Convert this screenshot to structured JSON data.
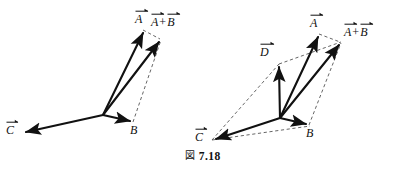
{
  "figure": {
    "caption_mark": "図",
    "caption_number": "7.18",
    "caption_full": "図 7.18",
    "background_color": "#ffffff",
    "solid_vector_color": "#111111",
    "dashed_line_color": "#555555"
  },
  "diagrams": [
    {
      "id": "left-diagram",
      "name": "two-vector-addition",
      "origin": {
        "x": 103,
        "y": 115
      },
      "vectors": [
        {
          "name": "vector-a",
          "label": "A",
          "arrow_over": true,
          "tip": {
            "x": 143,
            "y": 30
          },
          "label_pos": {
            "x": 137,
            "y": 10
          }
        },
        {
          "name": "vector-b",
          "label": "B",
          "arrow_over": false,
          "tip": {
            "x": 133,
            "y": 122
          },
          "label_pos": {
            "x": 131,
            "y": 126
          }
        },
        {
          "name": "vector-c",
          "label": "C",
          "arrow_over": true,
          "tip": {
            "x": 22,
            "y": 133
          },
          "label_pos": {
            "x": 8,
            "y": 122
          }
        },
        {
          "name": "vector-a-plus-b",
          "label": "A",
          "label2": "B",
          "plus": "+",
          "arrow_over": true,
          "tip": {
            "x": 161,
            "y": 39
          },
          "label_pos": {
            "x": 154,
            "y": 13
          }
        }
      ],
      "dashed_edges": [
        {
          "from": "vector-a-tip",
          "to": "vector-ab-tip"
        },
        {
          "from": "vector-b-tip",
          "to": "vector-ab-tip"
        }
      ]
    },
    {
      "id": "right-diagram",
      "name": "three-vector-addition-with-resultant-d",
      "origin": {
        "x": 280,
        "y": 118
      },
      "vectors": [
        {
          "name": "vector-a",
          "label": "A",
          "arrow_over": true,
          "tip": {
            "x": 319,
            "y": 34
          },
          "label_pos": {
            "x": 312,
            "y": 14
          }
        },
        {
          "name": "vector-b",
          "label": "B",
          "arrow_over": false,
          "tip": {
            "x": 309,
            "y": 125
          },
          "label_pos": {
            "x": 307,
            "y": 129
          }
        },
        {
          "name": "vector-c",
          "label": "C",
          "arrow_over": true,
          "tip": {
            "x": 212,
            "y": 140
          },
          "label_pos": {
            "x": 197,
            "y": 129
          }
        },
        {
          "name": "vector-d",
          "label": "D",
          "arrow_over": true,
          "tip": {
            "x": 279,
            "y": 64
          },
          "label_pos": {
            "x": 262,
            "y": 43
          }
        },
        {
          "name": "vector-a-plus-b",
          "label": "A",
          "label2": "B",
          "plus": "+",
          "arrow_over": true,
          "tip": {
            "x": 341,
            "y": 42
          },
          "label_pos": {
            "x": 345,
            "y": 23
          }
        }
      ],
      "dashed_edges": [
        {
          "from": "vector-a-tip",
          "to": "vector-ab-tip"
        },
        {
          "from": "vector-b-tip",
          "to": "vector-ab-tip"
        },
        {
          "from": "vector-c-tip",
          "to": "vector-d-tip"
        },
        {
          "from": "vector-d-tip",
          "to": "vector-ab-tip"
        },
        {
          "from": "vector-c-tip",
          "to": "origin"
        }
      ]
    }
  ]
}
